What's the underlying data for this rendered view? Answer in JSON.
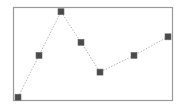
{
  "chart_data": {
    "type": "line",
    "title": "",
    "xlabel": "",
    "ylabel": "",
    "x": [
      1,
      2,
      3,
      4,
      5,
      6,
      7
    ],
    "x_pixel": [
      18,
      39,
      61,
      81,
      100,
      134,
      168
    ],
    "values": [
      3,
      48,
      95,
      62,
      30,
      48,
      68
    ],
    "ylim": [
      0,
      100
    ],
    "grid": false,
    "legend": null,
    "line_style": "dotted",
    "marker": "square"
  },
  "style": {
    "frame_color": "#9a9a9a",
    "line_color": "#b8b8b8",
    "marker_fill": "#4a4a4a",
    "marker_stroke": "#6a6a6a",
    "background": "#ffffff"
  },
  "layout": {
    "frame": {
      "x": 13,
      "y": 7,
      "width": 159,
      "height": 93
    },
    "marker_size": 6
  }
}
